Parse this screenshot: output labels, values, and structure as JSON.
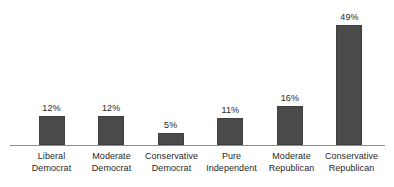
{
  "chart_data": {
    "type": "bar",
    "title": "",
    "subtitle": "",
    "xlabel": "",
    "ylabel": "",
    "categories": [
      "Liberal Democrat",
      "Moderate Democrat",
      "Conservative Democrat",
      "Pure Independent",
      "Moderate Republican",
      "Conservative Republican"
    ],
    "category_lines": [
      [
        "Liberal",
        "Democrat"
      ],
      [
        "Moderate",
        "Democrat"
      ],
      [
        "Conservative",
        "Democrat"
      ],
      [
        "Pure",
        "Independent"
      ],
      [
        "Moderate",
        "Republican"
      ],
      [
        "Conservative",
        "Republican"
      ]
    ],
    "values": [
      12,
      12,
      5,
      11,
      16,
      49
    ],
    "value_labels": [
      "12%",
      "12%",
      "5%",
      "11%",
      "16%",
      "49%"
    ],
    "ylim": [
      0,
      49
    ],
    "grid": false,
    "legend": false,
    "axis_visible": {
      "x": true,
      "y": false
    },
    "colors": {
      "bar_fill": "#4a4a4a",
      "bar_stroke": "#3f3f3f",
      "axis_line": "#8d8d8d",
      "background": "#ffffff",
      "label_text": "#1f1f1f",
      "value_text": "#262626"
    }
  }
}
